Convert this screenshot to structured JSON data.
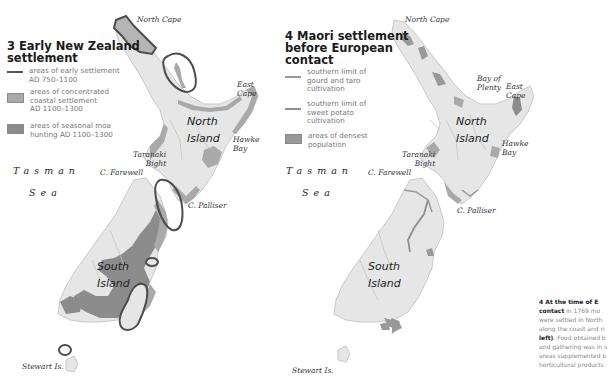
{
  "map3": {
    "title_line1": "3 Early New Zealand",
    "title_line2": "settlement",
    "legend": [
      {
        "swatch": "line-dark",
        "line1": "areas of early settlement",
        "line2": "AD 750–1100",
        "line3": ""
      },
      {
        "swatch": "box-light",
        "line1": "areas of concentrated",
        "line2": "coastal settlement",
        "line3": "AD 1100–1300"
      },
      {
        "swatch": "box-dark",
        "line1": "areas of seasonal moa",
        "line2": "hunting AD 1100–1300",
        "line3": ""
      }
    ],
    "labels": {
      "north_cape": "North Cape",
      "east_cape_1": "East",
      "east_cape_2": "Cape",
      "north_island_1": "North",
      "north_island_2": "Island",
      "hawke_1": "Hawke",
      "hawke_2": "Bay",
      "taranaki_1": "Taranaki",
      "taranaki_2": "Bight",
      "farewell": "C. Farewell",
      "palliser": "C. Palliser",
      "south_island_1": "South",
      "south_island_2": "Island",
      "stewart": "Stewart Is.",
      "sea_1": "Tasman",
      "sea_2": "Sea"
    }
  },
  "map4": {
    "title_line1": "4 Maori settlement",
    "title_line2": "before European",
    "title_line3": "contact",
    "legend": [
      {
        "swatch": "line-mid",
        "line1": "southern limit of",
        "line2": "gourd and taro",
        "line3": "cultivation"
      },
      {
        "swatch": "line-mid",
        "line1": "southern limit of",
        "line2": "sweet potato",
        "line3": "cultivation"
      },
      {
        "swatch": "box-dark",
        "line1": "areas of densest",
        "line2": "population",
        "line3": ""
      }
    ],
    "labels": {
      "north_cape": "North Cape",
      "bay_plenty_1": "Bay of",
      "bay_plenty_2": "Plenty",
      "east_cape_1": "East",
      "east_cape_2": "Cape",
      "north_island_1": "North",
      "north_island_2": "Island",
      "hawke_1": "Hawke",
      "hawke_2": "Bay",
      "taranaki_1": "Taranaki",
      "taranaki_2": "Bight",
      "farewell": "C. Farewell",
      "palliser": "C. Palliser",
      "south_island_1": "South",
      "south_island_2": "Island",
      "stewart": "Stewart Is.",
      "sea_1": "Tasman",
      "sea_2": "Sea"
    }
  },
  "caption": {
    "lead_1": "4 At the time of E",
    "lead_2": "contact",
    "rest_1": " in 1769 mo",
    "line_3": "were settled in North",
    "line_4": "along the coast and ri",
    "bold_5": "left)",
    "rest_5": ". Food obtained b",
    "line_6": "and gathering was in s",
    "line_7": "areas supplemented b",
    "line_8": "horticultural products"
  },
  "colors": {
    "land": "#e6e6e6",
    "land_outline": "#c8c8c8",
    "coastal_band": "#a9a9a9",
    "moa_dark": "#8c8c8c",
    "settlement_line": "#555555",
    "limit_line": "#9a9a9a"
  }
}
